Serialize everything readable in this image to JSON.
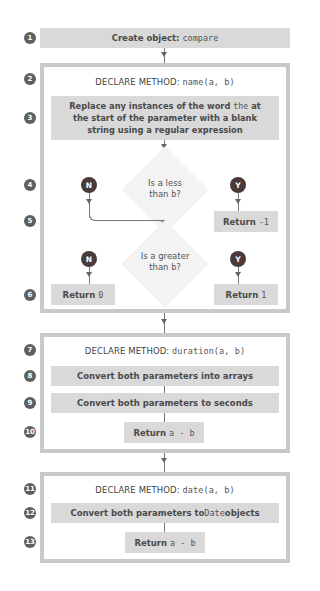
{
  "diagram": {
    "steps": [
      {
        "num": "1",
        "label": "Create object:",
        "code": "compare"
      },
      {
        "num": "2",
        "label": "DECLARE METHOD:",
        "code": "name(a, b)"
      },
      {
        "num": "3",
        "text": "Replace any instances of the word the at the start of the parameter with a blank string using a regular expression",
        "line1_pre": "Replace any instances of the word ",
        "line1_code": "the",
        "line1_post": " at",
        "line2": "the start of the parameter with a blank",
        "line3": "string using a regular expression"
      },
      {
        "num": "4",
        "question_line1": "Is a less",
        "question_line2_pre": "than ",
        "question_line2_code": "b",
        "question_line2_post": "?",
        "no": "N",
        "yes": "Y"
      },
      {
        "num": "5",
        "return_label": "Return",
        "return_code": "-1"
      },
      {
        "num": "6",
        "question_line1": "Is a greater",
        "question_line2_pre": "than ",
        "question_line2_code": "b",
        "question_line2_post": "?",
        "no": "N",
        "yes": "Y",
        "return_no_label": "Return",
        "return_no_code": "0",
        "return_yes_label": "Return",
        "return_yes_code": "1"
      },
      {
        "num": "7",
        "label": "DECLARE METHOD:",
        "code": "duration(a, b)"
      },
      {
        "num": "8",
        "text": "Convert both parameters into arrays"
      },
      {
        "num": "9",
        "text": "Convert both parameters to seconds"
      },
      {
        "num": "10",
        "return_label": "Return",
        "return_code": "a - b"
      },
      {
        "num": "11",
        "label": "DECLARE METHOD:",
        "code": "date(a, b)"
      },
      {
        "num": "12",
        "text_pre": "Convert both parameters to ",
        "text_code": "Date",
        "text_post": " objects"
      },
      {
        "num": "13",
        "return_label": "Return",
        "return_code": "a - b"
      }
    ]
  },
  "colors": {
    "box_fill": "#d9d9d9",
    "frame_border": "#c9c9c9",
    "step_badge": "#5f5f5f",
    "yes_no_badge": "#4a3a3a",
    "diamond_fill": "#f3f3f3"
  }
}
